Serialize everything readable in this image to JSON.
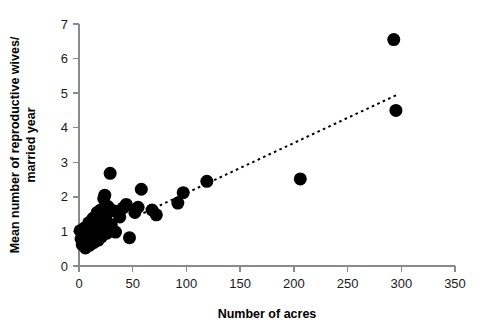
{
  "chart_data": {
    "type": "scatter",
    "title": "",
    "xlabel": "Number of acres",
    "ylabel": "Mean number of reproductive wives/ married year",
    "ylabel_line1": "Mean number of reproductive wives/",
    "ylabel_line2": "married year",
    "xlim": [
      0,
      350
    ],
    "ylim": [
      0,
      7
    ],
    "xticks": [
      0,
      50,
      100,
      150,
      200,
      250,
      300,
      350
    ],
    "yticks": [
      0,
      1,
      2,
      3,
      4,
      5,
      6,
      7
    ],
    "xtick_labels": [
      "0",
      "50",
      "100",
      "150",
      "200",
      "250",
      "300",
      "350"
    ],
    "ytick_labels": [
      "0",
      "1",
      "2",
      "3",
      "4",
      "5",
      "6",
      "7"
    ],
    "grid": false,
    "legend": "none",
    "marker": "filled-circle",
    "marker_color": "#000000",
    "point_radius_px": 6.5,
    "points": [
      {
        "x": 1,
        "y": 1.02
      },
      {
        "x": 2,
        "y": 0.78
      },
      {
        "x": 3,
        "y": 0.62
      },
      {
        "x": 4,
        "y": 0.88
      },
      {
        "x": 5,
        "y": 1.1
      },
      {
        "x": 6,
        "y": 0.52
      },
      {
        "x": 7,
        "y": 0.72
      },
      {
        "x": 8,
        "y": 0.95
      },
      {
        "x": 9,
        "y": 1.25
      },
      {
        "x": 10,
        "y": 0.6
      },
      {
        "x": 11,
        "y": 0.82
      },
      {
        "x": 12,
        "y": 1.0
      },
      {
        "x": 13,
        "y": 1.38
      },
      {
        "x": 14,
        "y": 0.68
      },
      {
        "x": 15,
        "y": 0.9
      },
      {
        "x": 16,
        "y": 1.15
      },
      {
        "x": 17,
        "y": 1.55
      },
      {
        "x": 18,
        "y": 0.75
      },
      {
        "x": 19,
        "y": 1.3
      },
      {
        "x": 20,
        "y": 1.62
      },
      {
        "x": 21,
        "y": 0.85
      },
      {
        "x": 22,
        "y": 1.08
      },
      {
        "x": 23,
        "y": 1.95
      },
      {
        "x": 24,
        "y": 2.05
      },
      {
        "x": 25,
        "y": 1.45
      },
      {
        "x": 26,
        "y": 0.95
      },
      {
        "x": 27,
        "y": 1.72
      },
      {
        "x": 29,
        "y": 2.68
      },
      {
        "x": 30,
        "y": 1.2
      },
      {
        "x": 32,
        "y": 1.6
      },
      {
        "x": 34,
        "y": 0.98
      },
      {
        "x": 38,
        "y": 1.42
      },
      {
        "x": 41,
        "y": 1.68
      },
      {
        "x": 44,
        "y": 1.78
      },
      {
        "x": 47,
        "y": 0.82
      },
      {
        "x": 52,
        "y": 1.55
      },
      {
        "x": 55,
        "y": 1.7
      },
      {
        "x": 58,
        "y": 2.22
      },
      {
        "x": 68,
        "y": 1.62
      },
      {
        "x": 72,
        "y": 1.48
      },
      {
        "x": 92,
        "y": 1.82
      },
      {
        "x": 97,
        "y": 2.12
      },
      {
        "x": 119,
        "y": 2.45
      },
      {
        "x": 206,
        "y": 2.52
      },
      {
        "x": 293,
        "y": 6.55
      },
      {
        "x": 295,
        "y": 4.5
      }
    ],
    "trendline": {
      "style": "dotted",
      "color": "#000000",
      "x_start": 60,
      "y_start": 1.53,
      "x_end": 296,
      "y_end": 4.95
    }
  }
}
